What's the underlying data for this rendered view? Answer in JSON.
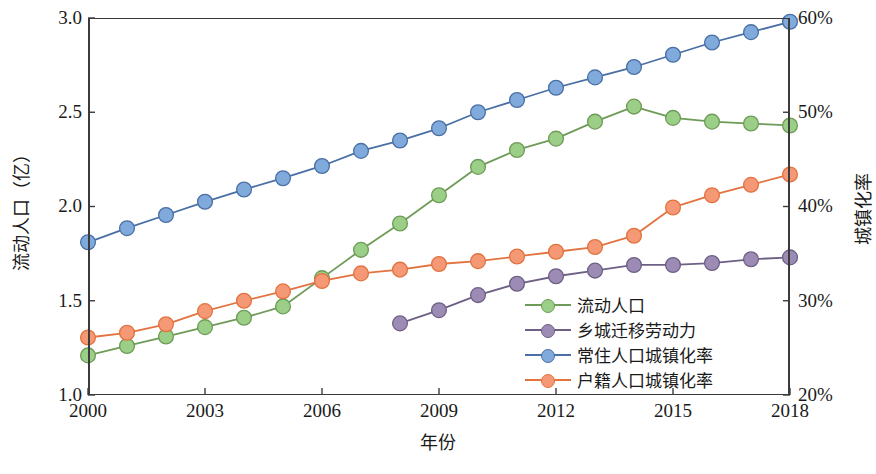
{
  "chart_data": {
    "type": "line",
    "title": "",
    "xlabel": "年份",
    "ylabel": "流动人口（亿）",
    "ylabel_right": "城镇化率",
    "x": [
      2000,
      2001,
      2002,
      2003,
      2004,
      2005,
      2006,
      2007,
      2008,
      2009,
      2010,
      2011,
      2012,
      2013,
      2014,
      2015,
      2016,
      2017,
      2018
    ],
    "xlim": [
      2000,
      2018
    ],
    "ylim": [
      1.0,
      3.0
    ],
    "ylim_right": [
      20,
      60
    ],
    "xticks": [
      "2000",
      "2003",
      "2006",
      "2009",
      "2012",
      "2015",
      "2018"
    ],
    "xtick_values": [
      2000,
      2003,
      2006,
      2009,
      2012,
      2015,
      2018
    ],
    "yticks_left": [
      "1.0",
      "1.5",
      "2.0",
      "2.5",
      "3.0"
    ],
    "ytick_values_left": [
      1.0,
      1.5,
      2.0,
      2.5,
      3.0
    ],
    "yticks_right": [
      "20%",
      "30%",
      "40%",
      "50%",
      "60%"
    ],
    "ytick_values_right": [
      20,
      30,
      40,
      50,
      60
    ],
    "grid": false,
    "legend_position": "center-right",
    "series": [
      {
        "name": "流动人口",
        "axis": "left",
        "color": "#9BCF87",
        "line_color": "#6E9B57",
        "x": [
          2000,
          2001,
          2002,
          2003,
          2004,
          2005,
          2006,
          2007,
          2008,
          2009,
          2010,
          2011,
          2012,
          2013,
          2014,
          2015,
          2016,
          2017,
          2018
        ],
        "values": [
          1.21,
          1.26,
          1.31,
          1.36,
          1.41,
          1.47,
          1.62,
          1.77,
          1.91,
          2.06,
          2.21,
          2.3,
          2.36,
          2.45,
          2.53,
          2.47,
          2.45,
          2.44,
          2.43
        ]
      },
      {
        "name": "乡城迁移劳动力",
        "axis": "left",
        "color": "#9C8BB4",
        "line_color": "#6E5F85",
        "x": [
          2008,
          2009,
          2010,
          2011,
          2012,
          2013,
          2014,
          2015,
          2016,
          2017,
          2018
        ],
        "values": [
          1.38,
          1.45,
          1.53,
          1.59,
          1.63,
          1.66,
          1.69,
          1.69,
          1.7,
          1.72,
          1.73
        ]
      },
      {
        "name": "常住人口城镇化率",
        "axis": "right",
        "color": "#80AADB",
        "line_color": "#4A6FA5",
        "x": [
          2000,
          2001,
          2002,
          2003,
          2004,
          2005,
          2006,
          2007,
          2008,
          2009,
          2010,
          2011,
          2012,
          2013,
          2014,
          2015,
          2016,
          2017,
          2018
        ],
        "values": [
          36.2,
          37.7,
          39.1,
          40.5,
          41.8,
          43.0,
          44.3,
          45.9,
          47.0,
          48.3,
          50.0,
          51.3,
          52.6,
          53.7,
          54.8,
          56.1,
          57.4,
          58.5,
          59.6
        ]
      },
      {
        "name": "户籍人口城镇化率",
        "axis": "right",
        "color": "#F59876",
        "line_color": "#E2733F",
        "x": [
          2000,
          2001,
          2002,
          2003,
          2004,
          2005,
          2006,
          2007,
          2008,
          2009,
          2010,
          2011,
          2012,
          2013,
          2014,
          2015,
          2016,
          2017,
          2018
        ],
        "values": [
          26.1,
          26.6,
          27.5,
          28.9,
          30.0,
          31.0,
          32.1,
          32.9,
          33.3,
          33.9,
          34.2,
          34.7,
          35.2,
          35.7,
          36.9,
          39.9,
          41.2,
          42.3,
          43.4
        ]
      }
    ]
  },
  "axes": {
    "left_title": "流动人口（亿）",
    "right_title": "城镇化率",
    "bottom_title": "年份"
  },
  "legend": {
    "items": [
      {
        "label": "流动人口",
        "color": "#9BCF87",
        "line_color": "#6E9B57"
      },
      {
        "label": "乡城迁移劳动力",
        "color": "#9C8BB4",
        "line_color": "#6E5F85"
      },
      {
        "label": "常住人口城镇化率",
        "color": "#80AADB",
        "line_color": "#4A6FA5"
      },
      {
        "label": "户籍人口城镇化率",
        "color": "#F59876",
        "line_color": "#E2733F"
      }
    ]
  },
  "caption": ""
}
